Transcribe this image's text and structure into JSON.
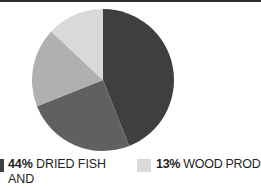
{
  "chart_data": {
    "type": "pie",
    "title": "",
    "legend_position": "bottom",
    "total_label_unit": "%",
    "slices": [
      {
        "label": "DRIED FISH AND WHALE OIL",
        "percent": 44,
        "percent_text": "44%",
        "color": "#3f3f3f",
        "start_angle_deg": 0,
        "end_angle_deg": 158.4,
        "in_legend": true
      },
      {
        "label": "",
        "percent": 25,
        "percent_text": "25%",
        "color": "#606060",
        "start_angle_deg": 158.4,
        "end_angle_deg": 248.4,
        "in_legend": false
      },
      {
        "label": "",
        "percent": 18,
        "percent_text": "18%",
        "color": "#b0b0b0",
        "start_angle_deg": 248.4,
        "end_angle_deg": 313.2,
        "in_legend": false
      },
      {
        "label": "WOOD PRODUCTS",
        "percent": 13,
        "percent_text": "13%",
        "color": "#d9d9d9",
        "start_angle_deg": 313.2,
        "end_angle_deg": 360,
        "in_legend": true
      }
    ]
  },
  "legend": {
    "entries": [
      {
        "percent_text": "44%",
        "label_line1": "DRIED FISH AND",
        "label_line2": "WHALE OIL",
        "swatch_color": "#3f3f3f"
      },
      {
        "percent_text": "13%",
        "label": "WOOD PRODUCTS",
        "swatch_color": "#d9d9d9"
      }
    ]
  },
  "colors": {
    "slice_darkest": "#3f3f3f",
    "slice_dark": "#606060",
    "slice_medium": "#b0b0b0",
    "slice_light": "#d9d9d9",
    "text": "#231f20",
    "rule": "#2f2f2f",
    "background": "#ffffff"
  }
}
